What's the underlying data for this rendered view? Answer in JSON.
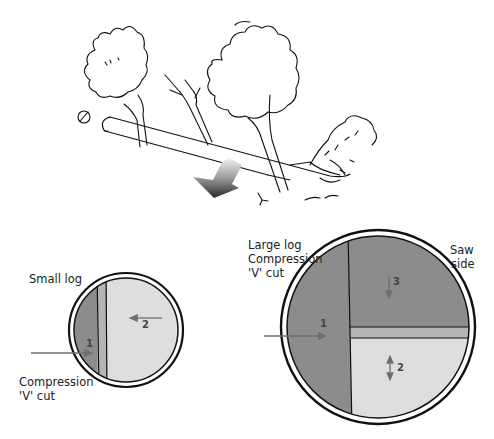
{
  "illustration": {
    "title": "Felled tree across a log - bucking cut sequence",
    "fall_direction_arrow": "down-left gradient arrow"
  },
  "small_log": {
    "label": "Small log",
    "cut_label_line1": "Compression",
    "cut_label_line2": "'V' cut",
    "steps": [
      {
        "number": "1",
        "direction": "right"
      },
      {
        "number": "2",
        "direction": "left"
      }
    ]
  },
  "large_log": {
    "label_line1": "Large log",
    "label_line2": "Compression",
    "label_line3": "'V' cut",
    "saw_side_line1": "Saw",
    "saw_side_line2": "side",
    "steps": [
      {
        "number": "1",
        "direction": "right"
      },
      {
        "number": "3",
        "direction": "down"
      },
      {
        "number": "2",
        "direction": "up-down"
      }
    ]
  },
  "colors": {
    "dark_section": "#8c8c8c",
    "mid_section": "#b5b5b5",
    "light_section": "#dedede",
    "arrow": "#6e6e6e",
    "outline": "#111111"
  }
}
